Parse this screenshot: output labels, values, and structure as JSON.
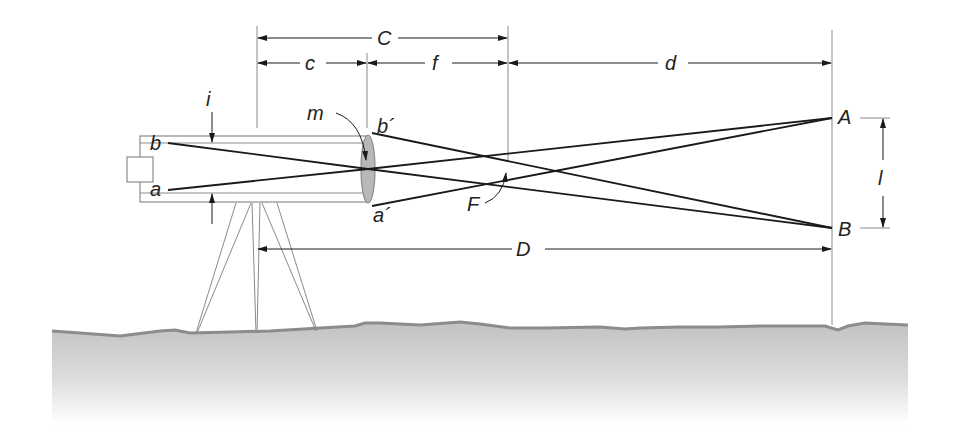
{
  "figure": {
    "colors": {
      "ray": "#1a1a1a",
      "construction": "#8a8a8a",
      "lens_fill": "#b8b8b8",
      "ground_edge": "#8c8c8c",
      "ground_fill_top": "#c4c4c4",
      "ground_fill_bottom": "#ffffff"
    }
  },
  "dimensions": {
    "C": "C",
    "c": "c",
    "f": "f",
    "d": "d",
    "D": "D",
    "i": "i",
    "l": "l"
  },
  "points": {
    "A": "A",
    "B": "B",
    "a": "a",
    "b": "b",
    "a_prime": "a´",
    "b_prime": "b´",
    "m": "m",
    "F": "F"
  }
}
